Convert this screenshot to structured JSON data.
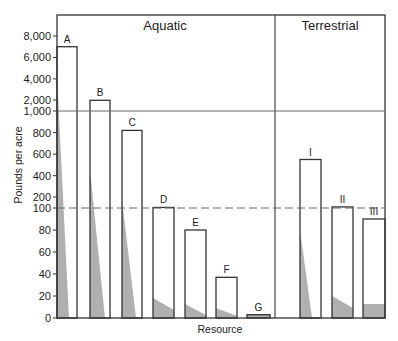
{
  "chart_data": {
    "type": "bar",
    "title": "",
    "xlabel": "Resource",
    "ylabel": "Pounds per acre",
    "sections": [
      {
        "name": "Aquatic",
        "categories": [
          "A",
          "B",
          "C",
          "D",
          "E",
          "F",
          "G"
        ]
      },
      {
        "name": "Terrestrial",
        "categories": [
          "I",
          "II",
          "III"
        ]
      }
    ],
    "categories": [
      "A",
      "B",
      "C",
      "D",
      "E",
      "F",
      "G",
      "I",
      "II",
      "III"
    ],
    "values": [
      7000,
      2000,
      820,
      105,
      80,
      37,
      3,
      550,
      110,
      90
    ],
    "y_scale": "broken: 0-100 by 20, 100-1000 by 200, 1000-8000 by 2000",
    "y_ticks": [
      "0",
      "20",
      "40",
      "60",
      "80",
      "100",
      "200",
      "400",
      "600",
      "800",
      "1,000",
      "2,000",
      "4,000",
      "6,000",
      "8,000"
    ],
    "reference_lines": [
      {
        "value": 1000,
        "style": "solid"
      },
      {
        "value": 100,
        "style": "dashed"
      }
    ],
    "grid": false,
    "legend": null
  },
  "labels": {
    "aquatic": "Aquatic",
    "terrestrial": "Terrestrial",
    "xlabel": "Resource",
    "ylabel": "Pounds per acre"
  },
  "colors": {
    "axis": "#333333",
    "bar_fill": "#ffffff",
    "bar_stroke": "#333333",
    "shade": "#b0b0b0",
    "ref_line": "#666666"
  }
}
